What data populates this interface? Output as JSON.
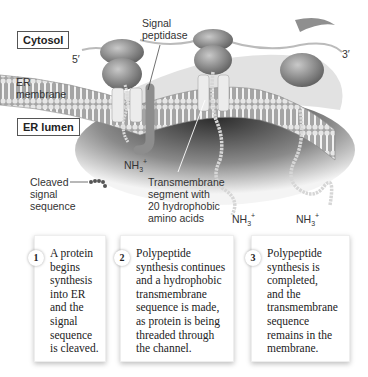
{
  "labels": {
    "cytosol": "Cytosol",
    "er_membrane_line1": "ER",
    "er_membrane_line2": "membrane",
    "er_lumen": "ER lumen",
    "signal_peptidase_line1": "Signal",
    "signal_peptidase_line2": "peptidase",
    "five_prime": "5′",
    "three_prime": "3′",
    "nh3_base": "NH",
    "nh3_sub": "3",
    "nh3_sup": "+",
    "cleaved_line1": "Cleaved",
    "cleaved_line2": "signal",
    "cleaved_line3": "sequence",
    "tm_line1": "Transmembrane",
    "tm_line2": "segment with",
    "tm_line3": "20 hydrophobic",
    "tm_line4": "amino acids"
  },
  "steps": [
    {
      "number": "1",
      "lines": [
        "A protein",
        "begins",
        "synthesis",
        "into ER",
        "and the",
        "signal",
        "sequence",
        "is cleaved."
      ]
    },
    {
      "number": "2",
      "lines": [
        "Polypeptide",
        "synthesis continues",
        "and a hydrophobic",
        "transmembrane",
        "sequence is made,",
        "as protein is being",
        "threaded through",
        "the channel."
      ]
    },
    {
      "number": "3",
      "lines": [
        "Polypeptide",
        "synthesis is",
        "completed,",
        "and the",
        "transmembrane",
        "sequence",
        "remains in the",
        "membrane."
      ]
    }
  ],
  "colors": {
    "membrane": "#9a9a9a",
    "ribosome": "#8a8a8a",
    "lumen_shadow": "#3a3a3a",
    "background": "#ffffff"
  }
}
